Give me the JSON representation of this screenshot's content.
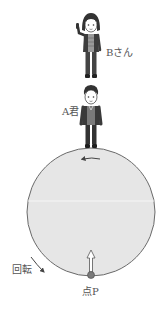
{
  "labels": {
    "person_b": "Bさん",
    "person_a": "A君",
    "rotation": "回転",
    "point_p": "点P"
  },
  "colors": {
    "disk_fill": "#e6e6e6",
    "disk_stroke": "#6a6a6a",
    "figure_dark": "#3a3a3a",
    "label": "#555555"
  }
}
